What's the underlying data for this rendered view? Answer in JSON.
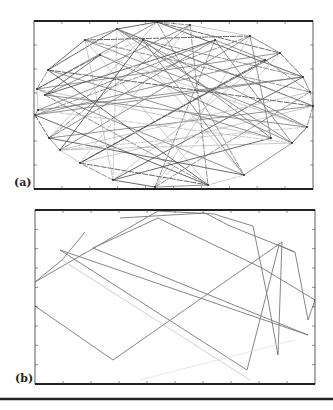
{
  "figure": {
    "panels": [
      {
        "id": "a",
        "label": "(a)",
        "frame": {
          "x": 34,
          "y": 21,
          "w": 279,
          "h": 168
        },
        "x_ticks": 10,
        "y_ticks": 7,
        "description": "Dense network of connections between points arranged on an ellipse"
      },
      {
        "id": "b",
        "label": "(b)",
        "frame": {
          "x": 35,
          "y": 210,
          "w": 280,
          "h": 174
        },
        "x_ticks": 10,
        "y_ticks": 9,
        "description": "Single polyline path visiting a subset of the points"
      }
    ],
    "colors": {
      "frame": "#333333",
      "line_dark": "#444444",
      "line_mid": "#777777",
      "line_light": "#bbbbbb",
      "divider": "#222222"
    }
  },
  "chart_data": [
    {
      "type": "network",
      "title": "(a)",
      "nodes": [
        [
          157,
          22
        ],
        [
          190,
          25
        ],
        [
          117,
          29
        ],
        [
          250,
          36
        ],
        [
          143,
          40
        ],
        [
          215,
          40
        ],
        [
          85,
          40
        ],
        [
          100,
          55
        ],
        [
          280,
          53
        ],
        [
          265,
          60
        ],
        [
          48,
          70
        ],
        [
          303,
          77
        ],
        [
          310,
          92
        ],
        [
          37,
          89
        ],
        [
          45,
          95
        ],
        [
          313,
          106
        ],
        [
          35,
          115
        ],
        [
          307,
          127
        ],
        [
          49,
          138
        ],
        [
          271,
          138
        ],
        [
          292,
          143
        ],
        [
          60,
          150
        ],
        [
          80,
          163
        ],
        [
          244,
          175
        ],
        [
          113,
          180
        ],
        [
          155,
          187
        ],
        [
          208,
          185
        ],
        [
          38,
          110
        ]
      ],
      "edges": [
        [
          0,
          8
        ],
        [
          0,
          13
        ],
        [
          0,
          18
        ],
        [
          0,
          23
        ],
        [
          0,
          11
        ],
        [
          2,
          15
        ],
        [
          2,
          24
        ],
        [
          2,
          20
        ],
        [
          2,
          10
        ],
        [
          3,
          16
        ],
        [
          3,
          25
        ],
        [
          3,
          21
        ],
        [
          3,
          6
        ],
        [
          6,
          17
        ],
        [
          6,
          26
        ],
        [
          6,
          12
        ],
        [
          8,
          22
        ],
        [
          8,
          13
        ],
        [
          8,
          25
        ],
        [
          11,
          16
        ],
        [
          11,
          24
        ],
        [
          11,
          4
        ],
        [
          13,
          19
        ],
        [
          13,
          23
        ],
        [
          13,
          7
        ],
        [
          15,
          18
        ],
        [
          15,
          22
        ],
        [
          15,
          2
        ],
        [
          16,
          26
        ],
        [
          16,
          9
        ],
        [
          17,
          21
        ],
        [
          17,
          2
        ],
        [
          18,
          23
        ],
        [
          18,
          1
        ],
        [
          20,
          21
        ],
        [
          20,
          5
        ],
        [
          22,
          26
        ],
        [
          23,
          4
        ],
        [
          24,
          9
        ],
        [
          25,
          12
        ],
        [
          26,
          10
        ],
        [
          1,
          14
        ],
        [
          1,
          22
        ],
        [
          4,
          19
        ],
        [
          5,
          14
        ],
        [
          5,
          25
        ],
        [
          7,
          17
        ],
        [
          7,
          20
        ],
        [
          9,
          22
        ],
        [
          10,
          19
        ],
        [
          12,
          21
        ],
        [
          14,
          26
        ],
        [
          19,
          24
        ],
        [
          27,
          11
        ],
        [
          27,
          20
        ],
        [
          27,
          5
        ],
        [
          0,
          2
        ],
        [
          0,
          1
        ],
        [
          1,
          3
        ],
        [
          3,
          8
        ],
        [
          8,
          11
        ],
        [
          11,
          12
        ],
        [
          12,
          15
        ],
        [
          15,
          17
        ],
        [
          17,
          20
        ],
        [
          20,
          23
        ],
        [
          23,
          26
        ],
        [
          26,
          25
        ],
        [
          25,
          24
        ],
        [
          24,
          22
        ],
        [
          22,
          21
        ],
        [
          21,
          18
        ],
        [
          18,
          16
        ],
        [
          16,
          27
        ],
        [
          27,
          13
        ],
        [
          13,
          10
        ],
        [
          10,
          6
        ],
        [
          6,
          2
        ],
        [
          4,
          7
        ],
        [
          5,
          9
        ],
        [
          7,
          14
        ],
        [
          9,
          12
        ],
        [
          6,
          24
        ],
        [
          3,
          19
        ],
        [
          10,
          15
        ],
        [
          14,
          17
        ],
        [
          2,
          23
        ],
        [
          1,
          26
        ],
        [
          4,
          21
        ],
        [
          5,
          18
        ]
      ],
      "xlim": [
        0,
        10
      ],
      "ylim": [
        0,
        7
      ]
    },
    {
      "type": "line",
      "title": "(b)",
      "path": [
        [
          85,
          232
        ],
        [
          62,
          260
        ],
        [
          35,
          282
        ],
        [
          158,
          211
        ],
        [
          215,
          214
        ],
        [
          220,
          216
        ],
        [
          253,
          226
        ],
        [
          268,
          300
        ],
        [
          278,
          355
        ],
        [
          282,
          242
        ],
        [
          113,
          360
        ],
        [
          35,
          306
        ]
      ],
      "path2": [
        [
          120,
          218
        ],
        [
          205,
          213
        ],
        [
          230,
          226
        ],
        [
          295,
          252
        ],
        [
          308,
          320
        ],
        [
          315,
          300
        ],
        [
          262,
          268
        ],
        [
          158,
          218
        ],
        [
          93,
          248
        ],
        [
          308,
          335
        ],
        [
          60,
          250
        ],
        [
          247,
          370
        ],
        [
          279,
          245
        ],
        [
          294,
          252
        ]
      ],
      "xlim": [
        0,
        10
      ],
      "ylim": [
        0,
        9
      ]
    }
  ]
}
